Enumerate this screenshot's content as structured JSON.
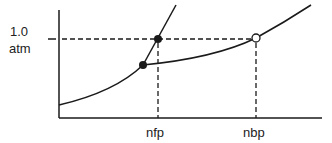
{
  "diagram": {
    "type": "phase-diagram",
    "y_label_line1": "1.0",
    "y_label_line2": "atm",
    "x_labels": {
      "nfp": "nfp",
      "nbp": "nbp"
    },
    "colors": {
      "line": "#1a1a1a",
      "text": "#222222",
      "background": "#ffffff"
    },
    "points": [
      {
        "name": "normal-freezing-point",
        "style": "filled"
      },
      {
        "name": "triple-point",
        "style": "filled"
      },
      {
        "name": "normal-boiling-point",
        "style": "open"
      }
    ]
  }
}
